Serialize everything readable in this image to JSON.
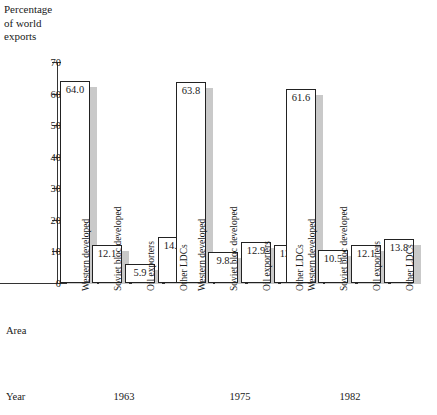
{
  "chart_data": {
    "type": "bar",
    "title": "Percentage\nof world\nexports",
    "xlabel": "Area",
    "ylabel": "Percentage of world exports",
    "ylim": [
      0,
      70
    ],
    "grid": false,
    "legend": "none",
    "yticks": [
      "0",
      "10",
      "20",
      "30",
      "40",
      "50",
      "60",
      "70"
    ],
    "categories": [
      "Western developed",
      "Soviet bloc developed",
      "Oil exporters",
      "Other LDCs"
    ],
    "groups": [
      "1963",
      "1975",
      "1982"
    ],
    "series": [
      {
        "name": "1963",
        "values": [
          64.0,
          12.1,
          5.9,
          14.6
        ],
        "labels": [
          "64.0",
          "12.1",
          "5.9",
          "14.6"
        ]
      },
      {
        "name": "1975",
        "values": [
          63.8,
          9.8,
          12.9,
          12.1
        ],
        "labels": [
          "63.8",
          "9.8",
          "12.9",
          "12.1"
        ]
      },
      {
        "name": "1982",
        "values": [
          61.6,
          10.5,
          12.1,
          13.8
        ],
        "labels": [
          "61.6",
          "10.5",
          "12.1",
          "13.8"
        ]
      }
    ],
    "row_headings": {
      "area": "Area",
      "year": "Year"
    },
    "colors": {
      "bar_fill": "#ffffff",
      "bar_outline": "#222222",
      "shadow": "#c9c9c9",
      "axis": "#333333"
    }
  }
}
